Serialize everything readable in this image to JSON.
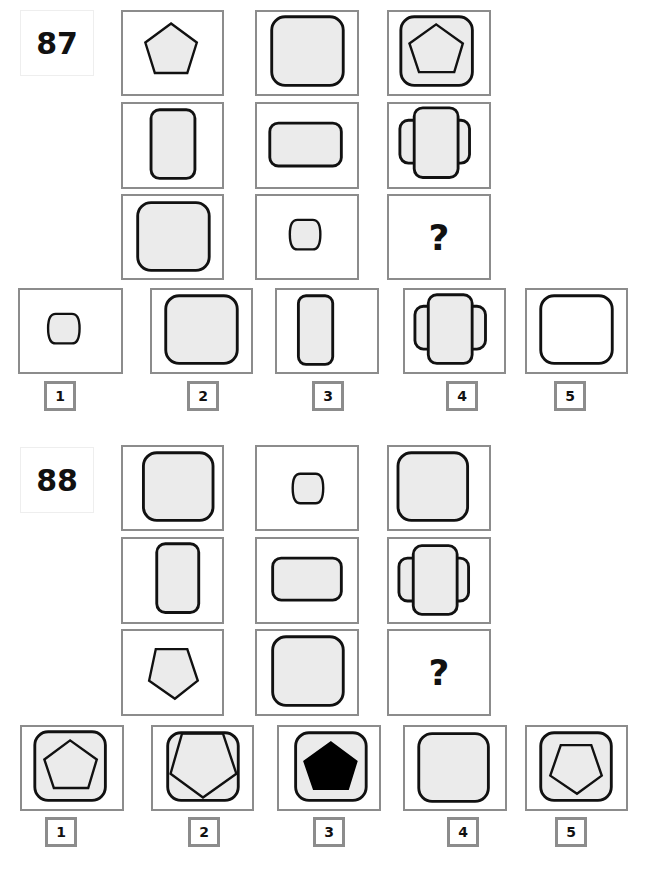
{
  "colors": {
    "border": "#8c8c8c",
    "stroke": "#111111",
    "fill": "#ebebeb"
  },
  "puzzles": [
    {
      "number": "87",
      "matrix": [
        [
          "pentagon",
          "big-rounded-square",
          "big-rounded-square-with-pentagon"
        ],
        [
          "tall-rounded-rect",
          "wide-rounded-rect",
          "cross-rects"
        ],
        [
          "big-rounded-square",
          "small-barrel",
          "question"
        ]
      ],
      "question_mark": "?",
      "options": [
        {
          "label": "1",
          "shape": "small-barrel"
        },
        {
          "label": "2",
          "shape": "big-rounded-square"
        },
        {
          "label": "3",
          "shape": "tall-rounded-rect"
        },
        {
          "label": "4",
          "shape": "cross-rects"
        },
        {
          "label": "5",
          "shape": "big-rounded-square-unfilled"
        }
      ]
    },
    {
      "number": "88",
      "matrix": [
        [
          "big-rounded-square",
          "small-barrel",
          "big-rounded-square"
        ],
        [
          "tall-rounded-rect",
          "wide-rounded-rect",
          "cross-rects"
        ],
        [
          "inverted-pentagon",
          "big-rounded-square",
          "question"
        ]
      ],
      "question_mark": "?",
      "options": [
        {
          "label": "1",
          "shape": "rounded-square-with-pentagon"
        },
        {
          "label": "2",
          "shape": "rounded-square-with-large-inverted-pentagon"
        },
        {
          "label": "3",
          "shape": "rounded-square-with-black-pentagon"
        },
        {
          "label": "4",
          "shape": "rounded-square"
        },
        {
          "label": "5",
          "shape": "rounded-square-with-inverted-pentagon"
        }
      ]
    }
  ]
}
